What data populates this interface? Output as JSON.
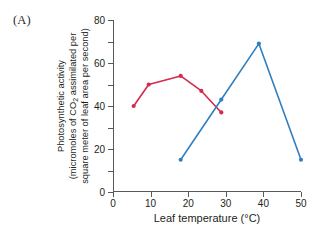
{
  "panel": {
    "label": "(A)"
  },
  "axes": {
    "x": {
      "label": "Leaf temperature (°C)",
      "ticks": [
        0,
        10,
        20,
        30,
        40,
        50
      ],
      "min": 0,
      "max": 50
    },
    "y": {
      "label_line1": "Photosynthetic activity",
      "label_line2_a": "(micromoles of CO",
      "label_line2_sub": "2",
      "label_line2_b": " assimilated per",
      "label_line3": "square meter of leaf area per second)",
      "ticks": [
        0,
        20,
        40,
        60,
        80
      ],
      "minor_ticks": [
        10,
        30,
        50,
        70
      ],
      "min": 0,
      "max": 80
    }
  },
  "colors": {
    "series_red": "#d32a4e",
    "series_blue": "#2f7fc1",
    "axis": "#58595b",
    "text": "#231f20",
    "background": "#ffffff"
  },
  "chart_data": {
    "type": "line",
    "title": "",
    "xlabel": "Leaf temperature (°C)",
    "ylabel": "Photosynthetic activity (micromoles of CO2 assimilated per square meter of leaf area per second)",
    "xlim": [
      0,
      50
    ],
    "ylim": [
      0,
      80
    ],
    "grid": false,
    "legend": "none",
    "markers": true,
    "series": [
      {
        "name": "cool-adapted species",
        "color": "#d32a4e",
        "points": [
          {
            "x": 5.5,
            "y": 40
          },
          {
            "x": 9.5,
            "y": 50
          },
          {
            "x": 18.0,
            "y": 54
          },
          {
            "x": 23.5,
            "y": 47
          },
          {
            "x": 28.8,
            "y": 37
          }
        ]
      },
      {
        "name": "heat-adapted species",
        "color": "#2f7fc1",
        "points": [
          {
            "x": 18.0,
            "y": 15
          },
          {
            "x": 28.8,
            "y": 43
          },
          {
            "x": 38.8,
            "y": 69
          },
          {
            "x": 50.0,
            "y": 15
          }
        ]
      }
    ]
  }
}
